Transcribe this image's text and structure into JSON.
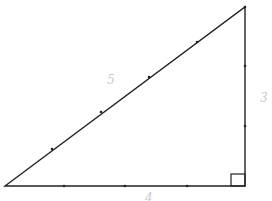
{
  "diagram": {
    "type": "right-triangle",
    "vertices": {
      "left": [
        5,
        186
      ],
      "top_right": [
        245,
        7
      ],
      "bottom_right": [
        245,
        186
      ]
    },
    "right_angle_marker": {
      "x": 231,
      "y": 174,
      "size": 14
    },
    "tick_marks": {
      "bottom": [
        [
          64,
          186
        ],
        [
          125,
          186
        ],
        [
          187,
          186
        ]
      ],
      "right": [
        [
          245,
          66
        ],
        [
          245,
          126
        ]
      ],
      "hypotenuse": [
        [
          52,
          149
        ],
        [
          101,
          112
        ],
        [
          149,
          77
        ],
        [
          197,
          42
        ]
      ]
    },
    "labels": {
      "hypotenuse": "5",
      "vertical_leg": "3",
      "horizontal_leg": "4"
    },
    "colors": {
      "line": "#222222",
      "label": "#c8c8c8"
    }
  }
}
